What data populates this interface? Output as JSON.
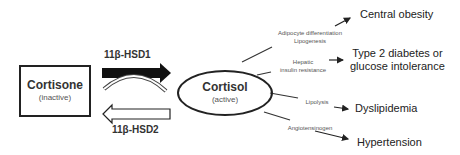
{
  "diagram": {
    "left_node": {
      "title": "Cortisone",
      "subtitle": "(inactive)"
    },
    "right_node": {
      "title": "Cortisol",
      "subtitle": "(active)"
    },
    "enzymes": {
      "forward": "11β-HSD1",
      "reverse": "11β-HSD2"
    },
    "mechanisms": [
      {
        "line1": "Adipocyte differentiation",
        "line2": "Lipogenesis"
      },
      {
        "line1": "Hepatic",
        "line2": "insulin resistance"
      },
      {
        "line1": "Lipolysis",
        "line2": ""
      },
      {
        "line1": "Angiotensinogen",
        "line2": ""
      }
    ],
    "outcomes": [
      {
        "line1": "Central obesity",
        "line2": ""
      },
      {
        "line1": "Type 2 diabetes or",
        "line2": "glucose intolerance"
      },
      {
        "line1": "Dyslipidemia",
        "line2": ""
      },
      {
        "line1": "Hypertension",
        "line2": ""
      }
    ],
    "colors": {
      "stroke": "#222222",
      "text": "#333333",
      "background": "#ffffff"
    }
  }
}
